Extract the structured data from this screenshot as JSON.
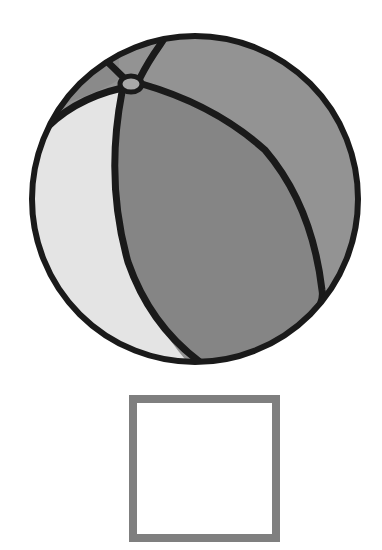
{
  "figure": {
    "segments": {
      "top_left_cap": {
        "color": "#8a8a8a"
      },
      "top_center": {
        "color": "#8e8e8e"
      },
      "left_light": {
        "color": "#e4e4e4"
      },
      "front_main": {
        "color": "#858585"
      },
      "right_back": {
        "color": "#939393"
      },
      "valve": {
        "color": "#a8a8a8"
      }
    },
    "outline_color": "#1a1a1a"
  },
  "answer_box": {
    "border_color": "#7f7f7f",
    "fill_color": "#ffffff",
    "value": ""
  }
}
